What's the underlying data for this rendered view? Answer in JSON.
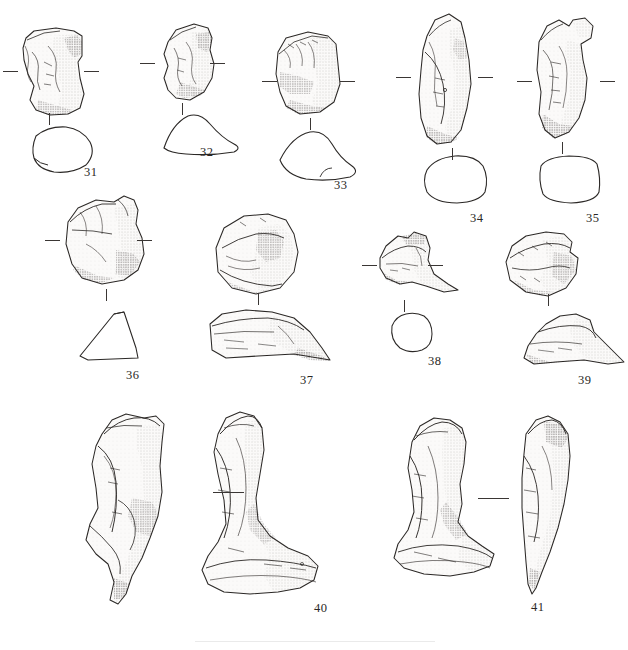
{
  "figure": {
    "kind": "archaeological-specimen-plate",
    "background_color": "#ffffff",
    "ink_color": "#231f20",
    "outline_color": "#3a3634",
    "width": 628,
    "height": 650,
    "number_count": 11
  },
  "specimens": [
    {
      "id": "31",
      "label": "31",
      "label_x": 84,
      "label_y": 165,
      "views": [
        "lateral-stipple-drawing",
        "cross-section-outline"
      ],
      "has_tick_marks": true,
      "tick_style": "paired-horizontal-dashes"
    },
    {
      "id": "32",
      "label": "32",
      "label_x": 200,
      "label_y": 145,
      "views": [
        "lateral-stipple-drawing",
        "cross-section-outline"
      ],
      "has_tick_marks": true,
      "tick_style": "paired-horizontal-dashes"
    },
    {
      "id": "33",
      "label": "33",
      "label_x": 334,
      "label_y": 178,
      "views": [
        "lateral-stipple-drawing",
        "cross-section-outline"
      ],
      "has_tick_marks": true,
      "tick_style": "paired-horizontal-dashes"
    },
    {
      "id": "34",
      "label": "34",
      "label_x": 470,
      "label_y": 211,
      "views": [
        "lateral-stipple-drawing",
        "cross-section-outline"
      ],
      "has_tick_marks": true,
      "tick_style": "paired-horizontal-dashes"
    },
    {
      "id": "35",
      "label": "35",
      "label_x": 586,
      "label_y": 211,
      "views": [
        "lateral-stipple-drawing",
        "cross-section-outline"
      ],
      "has_tick_marks": true,
      "tick_style": "paired-horizontal-dashes"
    },
    {
      "id": "36",
      "label": "36",
      "label_x": 126,
      "label_y": 368,
      "views": [
        "lateral-stipple-drawing",
        "cross-section-outline"
      ],
      "has_tick_marks": true,
      "tick_style": "paired-horizontal-dashes"
    },
    {
      "id": "37",
      "label": "37",
      "label_x": 300,
      "label_y": 373,
      "views": [
        "proximal-stipple-drawing",
        "lateral-stipple-drawing"
      ],
      "has_tick_marks": false,
      "tick_style": "single-vertical-dash"
    },
    {
      "id": "38",
      "label": "38",
      "label_x": 428,
      "label_y": 354,
      "views": [
        "lateral-stipple-drawing",
        "cross-section-outline"
      ],
      "has_tick_marks": true,
      "tick_style": "paired-horizontal-dashes"
    },
    {
      "id": "39",
      "label": "39",
      "label_x": 578,
      "label_y": 373,
      "views": [
        "proximal-stipple-drawing",
        "lateral-stipple-drawing"
      ],
      "has_tick_marks": false,
      "tick_style": "single-vertical-dash"
    },
    {
      "id": "40",
      "label": "40",
      "label_x": 314,
      "label_y": 601,
      "views": [
        "lateral-stipple-drawing",
        "anterior-stipple-drawing"
      ],
      "has_tick_marks": true,
      "tick_style": "single-horizontal-rule-between-views"
    },
    {
      "id": "41",
      "label": "41",
      "label_x": 531,
      "label_y": 600,
      "views": [
        "anterior-stipple-drawing",
        "lateral-stipple-drawing"
      ],
      "has_tick_marks": true,
      "tick_style": "single-horizontal-rule-between-views"
    }
  ]
}
